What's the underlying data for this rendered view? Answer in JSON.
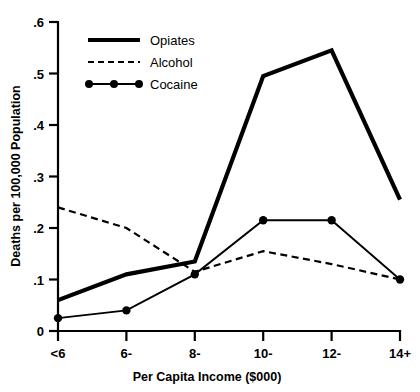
{
  "chart_data": {
    "type": "line",
    "title": "",
    "xlabel": "Per Capita Income ($000)",
    "ylabel": "Deaths per 100,000 Population",
    "categories": [
      "<6",
      "6-",
      "8-",
      "10-",
      "12-",
      "14+"
    ],
    "x_tick_labels": [
      "<6",
      "6-",
      "8-",
      "10-",
      "12-",
      "14+"
    ],
    "y_tick_labels": [
      "0",
      ".1",
      ".2",
      ".3",
      ".4",
      ".5",
      ".6"
    ],
    "y_tick_values": [
      0,
      0.1,
      0.2,
      0.3,
      0.4,
      0.5,
      0.6
    ],
    "ylim": [
      0,
      0.6
    ],
    "grid": false,
    "legend_position": "top-left-inside",
    "series": [
      {
        "name": "Opiates",
        "style": "solid-thick",
        "markers": false,
        "values": [
          0.06,
          0.11,
          0.135,
          0.495,
          0.545,
          0.255
        ]
      },
      {
        "name": "Alcohol",
        "style": "dashed",
        "markers": false,
        "values": [
          0.24,
          0.2,
          0.115,
          0.155,
          0.13,
          0.1
        ]
      },
      {
        "name": "Cocaine",
        "style": "solid-thin-dots",
        "markers": true,
        "values": [
          0.025,
          0.04,
          0.11,
          0.215,
          0.215,
          0.1
        ]
      }
    ]
  },
  "legend": {
    "items": [
      {
        "label": "Opiates"
      },
      {
        "label": "Alcohol"
      },
      {
        "label": "Cocaine"
      }
    ]
  },
  "axes": {
    "y_title": "Deaths per 100,000 Population",
    "x_title": "Per Capita Income ($000)"
  },
  "colors": {
    "ink": "#000000",
    "background": "#ffffff"
  }
}
